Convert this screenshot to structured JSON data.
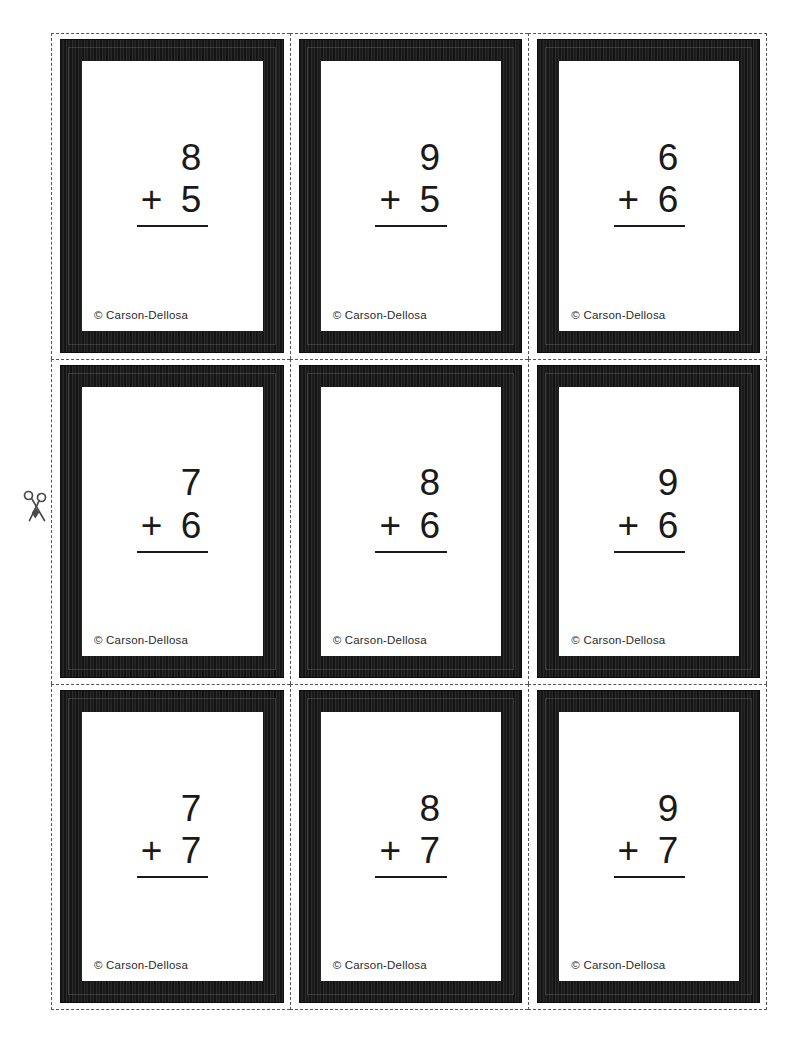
{
  "page": {
    "background_color": "#ffffff",
    "cut_line_color": "#555555",
    "card_border_color": "#1b1b1b",
    "ink_color": "#1a1a1a"
  },
  "markers": {
    "scissors_icon": "scissors-icon",
    "cut_here_label": "cut"
  },
  "cards": [
    {
      "row": 1,
      "col": 1,
      "top_operand": "8",
      "operator": "+",
      "bottom_operand": "5",
      "copyright": "© Carson-Dellosa"
    },
    {
      "row": 1,
      "col": 2,
      "top_operand": "9",
      "operator": "+",
      "bottom_operand": "5",
      "copyright": "© Carson-Dellosa"
    },
    {
      "row": 1,
      "col": 3,
      "top_operand": "6",
      "operator": "+",
      "bottom_operand": "6",
      "copyright": "© Carson-Dellosa"
    },
    {
      "row": 2,
      "col": 1,
      "top_operand": "7",
      "operator": "+",
      "bottom_operand": "6",
      "copyright": "© Carson-Dellosa"
    },
    {
      "row": 2,
      "col": 2,
      "top_operand": "8",
      "operator": "+",
      "bottom_operand": "6",
      "copyright": "© Carson-Dellosa"
    },
    {
      "row": 2,
      "col": 3,
      "top_operand": "9",
      "operator": "+",
      "bottom_operand": "6",
      "copyright": "© Carson-Dellosa"
    },
    {
      "row": 3,
      "col": 1,
      "top_operand": "7",
      "operator": "+",
      "bottom_operand": "7",
      "copyright": "© Carson-Dellosa"
    },
    {
      "row": 3,
      "col": 2,
      "top_operand": "8",
      "operator": "+",
      "bottom_operand": "7",
      "copyright": "© Carson-Dellosa"
    },
    {
      "row": 3,
      "col": 3,
      "top_operand": "9",
      "operator": "+",
      "bottom_operand": "7",
      "copyright": "© Carson-Dellosa"
    }
  ]
}
